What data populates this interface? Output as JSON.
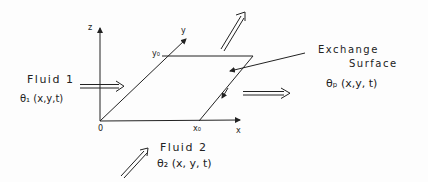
{
  "diagram": {
    "axes": {
      "z_label": "z",
      "y_label": "y",
      "x_label": "x",
      "origin_label": "0",
      "y0_label": "y₀",
      "x0_label": "x₀"
    },
    "fluid1": {
      "name": "Fluid 1",
      "temperature": "θ₁ (x,y,t)"
    },
    "fluid2": {
      "name": "Fluid 2",
      "temperature": "θ₂ (x, y, t)"
    },
    "surface": {
      "line1": "Exchange",
      "line2": "Surface",
      "temperature": "θₚ (x,y, t)"
    },
    "colors": {
      "ink": "#222222",
      "background": "#fdfdfd"
    }
  }
}
